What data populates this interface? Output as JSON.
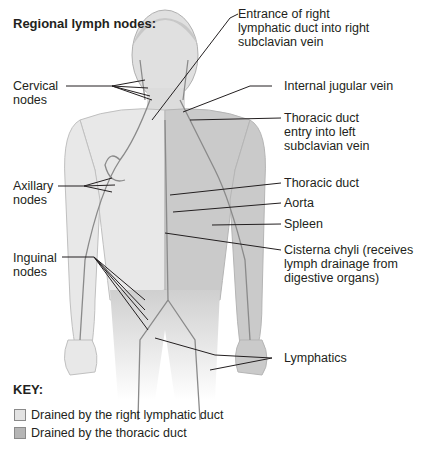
{
  "title": "Regional lymph nodes:",
  "left_labels": {
    "cervical": [
      "Cervical",
      "nodes"
    ],
    "axillary": [
      "Axillary",
      "nodes"
    ],
    "inguinal": [
      "Inguinal",
      "nodes"
    ]
  },
  "right_labels": {
    "entrance_right_duct": [
      "Entrance of right",
      "lymphatic duct into right",
      "subclavian vein"
    ],
    "internal_jugular": "Internal jugular vein",
    "thoracic_entry": [
      "Thoracic duct",
      "entry into left",
      "subclavian vein"
    ],
    "thoracic_duct": "Thoracic duct",
    "aorta": "Aorta",
    "spleen": "Spleen",
    "cisterna": [
      "Cisterna chyli (receives",
      "lymph drainage from",
      "digestive organs)"
    ],
    "lymphatics": "Lymphatics"
  },
  "key": {
    "title": "KEY:",
    "items": [
      {
        "label": "Drained by the right lymphatic duct",
        "color": "#e3e3e3"
      },
      {
        "label": "Drained by the thoracic duct",
        "color": "#b5b5b5"
      }
    ]
  },
  "colors": {
    "body_light": "#e6e6e6",
    "body_dark": "#c9c9c9",
    "vessel": "#8a8a8a",
    "leader_line": "#231f20"
  }
}
